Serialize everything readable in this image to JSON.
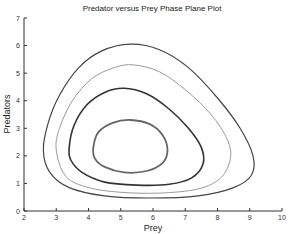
{
  "chart_data": {
    "type": "line",
    "title": "Predator versus Prey Phase Plane Plot",
    "xlabel": "Prey",
    "ylabel": "Predators",
    "xlim": [
      2,
      10
    ],
    "ylim": [
      0,
      7
    ],
    "xticks": [
      "2",
      "3",
      "4",
      "5",
      "6",
      "7",
      "8",
      "9",
      "10"
    ],
    "yticks": [
      "0",
      "1",
      "2",
      "3",
      "4",
      "5",
      "6",
      "7"
    ],
    "grid": false,
    "legend": null,
    "series": [
      {
        "name": "orbit-1-outer",
        "color": "#444444",
        "width": 1.2,
        "points": [
          [
            2.6,
            2.2
          ],
          [
            2.75,
            3.2
          ],
          [
            3.1,
            4.2
          ],
          [
            3.7,
            5.2
          ],
          [
            4.4,
            5.8
          ],
          [
            5.3,
            6.05
          ],
          [
            6.2,
            5.85
          ],
          [
            7.1,
            5.2
          ],
          [
            8.0,
            4.1
          ],
          [
            8.7,
            3.0
          ],
          [
            9.1,
            2.0
          ],
          [
            9.05,
            1.3
          ],
          [
            8.5,
            0.85
          ],
          [
            7.4,
            0.55
          ],
          [
            5.9,
            0.47
          ],
          [
            4.5,
            0.55
          ],
          [
            3.4,
            0.85
          ],
          [
            2.8,
            1.4
          ]
        ]
      },
      {
        "name": "orbit-2",
        "color": "#9a9a9a",
        "width": 1.0,
        "points": [
          [
            3.0,
            2.2
          ],
          [
            3.1,
            3.0
          ],
          [
            3.5,
            4.0
          ],
          [
            4.1,
            4.8
          ],
          [
            4.8,
            5.2
          ],
          [
            5.4,
            5.3
          ],
          [
            6.2,
            5.05
          ],
          [
            7.0,
            4.4
          ],
          [
            7.8,
            3.5
          ],
          [
            8.3,
            2.6
          ],
          [
            8.4,
            1.9
          ],
          [
            8.1,
            1.2
          ],
          [
            7.4,
            0.8
          ],
          [
            6.2,
            0.65
          ],
          [
            5.0,
            0.68
          ],
          [
            4.0,
            0.85
          ],
          [
            3.3,
            1.25
          ]
        ]
      },
      {
        "name": "orbit-3",
        "color": "#333333",
        "width": 1.6,
        "points": [
          [
            3.4,
            2.3
          ],
          [
            3.55,
            3.1
          ],
          [
            3.95,
            3.85
          ],
          [
            4.5,
            4.3
          ],
          [
            5.1,
            4.45
          ],
          [
            5.8,
            4.25
          ],
          [
            6.5,
            3.7
          ],
          [
            7.1,
            3.0
          ],
          [
            7.5,
            2.3
          ],
          [
            7.55,
            1.7
          ],
          [
            7.2,
            1.2
          ],
          [
            6.5,
            0.97
          ],
          [
            5.5,
            0.94
          ],
          [
            4.5,
            1.05
          ],
          [
            3.8,
            1.4
          ],
          [
            3.45,
            1.85
          ]
        ]
      },
      {
        "name": "orbit-4-inner",
        "color": "#666666",
        "width": 1.8,
        "points": [
          [
            4.15,
            2.3
          ],
          [
            4.3,
            2.85
          ],
          [
            4.75,
            3.2
          ],
          [
            5.3,
            3.3
          ],
          [
            5.9,
            3.15
          ],
          [
            6.3,
            2.75
          ],
          [
            6.45,
            2.2
          ],
          [
            6.3,
            1.75
          ],
          [
            5.8,
            1.45
          ],
          [
            5.1,
            1.4
          ],
          [
            4.5,
            1.6
          ],
          [
            4.2,
            1.9
          ]
        ]
      }
    ]
  }
}
